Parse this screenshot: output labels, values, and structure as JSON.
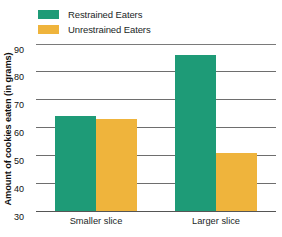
{
  "chart_data": {
    "type": "bar",
    "title": "",
    "xlabel": "",
    "ylabel": "Amount of cookies eaten (in grams)",
    "categories": [
      "Smaller slice",
      "Larger slice"
    ],
    "series": [
      {
        "name": "Restrained Eaters",
        "color": "#1e9b77",
        "values": [
          64,
          86
        ]
      },
      {
        "name": "Unrestrained Eaters",
        "color": "#efb43c",
        "values": [
          63,
          51
        ]
      }
    ],
    "ylim": [
      30,
      90
    ],
    "yticks": [
      30,
      40,
      50,
      60,
      70,
      80,
      90
    ],
    "ytick_labels": [
      "30",
      "40",
      "50",
      "60",
      "70",
      "80",
      "90"
    ],
    "grid": "horizontal",
    "legend_position": "top-left"
  },
  "legend": {
    "items": [
      {
        "label": "Restrained Eaters",
        "color": "#1e9b77"
      },
      {
        "label": "Unrestrained Eaters",
        "color": "#efb43c"
      }
    ]
  },
  "axes": {
    "y_title": "Amount of cookies eaten (in grams)"
  }
}
